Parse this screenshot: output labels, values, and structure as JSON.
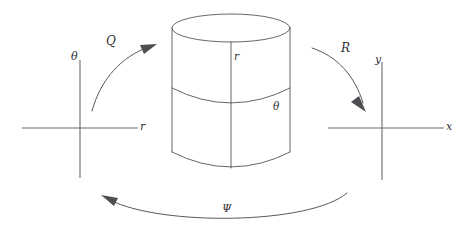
{
  "diagram": {
    "background_color": "#ffffff",
    "line_color": "#55565a",
    "label_color": "#303034",
    "left_plane": {
      "name": "polar-coordinate-plane",
      "vertical_axis_label": "θ",
      "horizontal_axis_label": "r"
    },
    "center_object": {
      "name": "cylinder",
      "vertical_label": "r",
      "circumferential_label": "θ"
    },
    "right_plane": {
      "name": "cartesian-coordinate-plane",
      "vertical_axis_label": "y",
      "horizontal_axis_label": "x"
    },
    "maps": {
      "q_label": "Q",
      "r_label": "R",
      "psi_label": "Ψ"
    }
  }
}
